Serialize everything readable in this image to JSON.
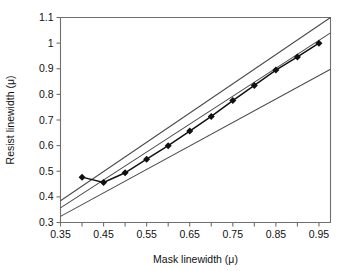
{
  "chart_data": {
    "type": "scatter",
    "title": "",
    "xlabel": "Mask linewidth (μ)",
    "ylabel": "Resist linewidth (μ)",
    "xlim": [
      0.35,
      0.9768
    ],
    "ylim": [
      0.3,
      1.1
    ],
    "grid": false,
    "legend": null,
    "xticks": [
      0.35,
      0.4,
      0.45,
      0.5,
      0.55,
      0.6,
      0.65,
      0.7,
      0.75,
      0.8,
      0.85,
      0.9,
      0.95
    ],
    "xtick_labels": [
      "0.35",
      "",
      "0.45",
      "",
      "0.55",
      "",
      "0.65",
      "",
      "0.75",
      "",
      "0.85",
      "",
      "0.95"
    ],
    "yticks": [
      0.3,
      0.4,
      0.5,
      0.6,
      0.7,
      0.8,
      0.9,
      1.0,
      1.1
    ],
    "ytick_labels": [
      "0.3",
      "0.4",
      "0.5",
      "0.6",
      "0.7",
      "0.8",
      "0.9",
      "1",
      "1.1"
    ],
    "series": [
      {
        "name": "Resist linewidth vs mask linewidth",
        "marker": "diamond",
        "marker_color": "#111111",
        "line_color": "#111111",
        "x": [
          0.4,
          0.45,
          0.5,
          0.55,
          0.6,
          0.65,
          0.7,
          0.75,
          0.8,
          0.85,
          0.9,
          0.95
        ],
        "y": [
          0.477,
          0.456,
          0.494,
          0.547,
          0.6,
          0.657,
          0.714,
          0.776,
          0.835,
          0.895,
          0.946,
          1.0
        ]
      }
    ],
    "reference_lines": [
      {
        "name": "upper-reference-line",
        "x": [
          0.35,
          0.9768
        ],
        "y": [
          0.385,
          1.1
        ],
        "color": "#4a4a4a"
      },
      {
        "name": "middle-reference-line",
        "x": [
          0.35,
          0.9768
        ],
        "y": [
          0.357,
          1.04
        ],
        "color": "#4a4a4a"
      },
      {
        "name": "lower-reference-line",
        "x": [
          0.35,
          0.9768
        ],
        "y": [
          0.324,
          0.898
        ],
        "color": "#4a4a4a"
      }
    ]
  }
}
